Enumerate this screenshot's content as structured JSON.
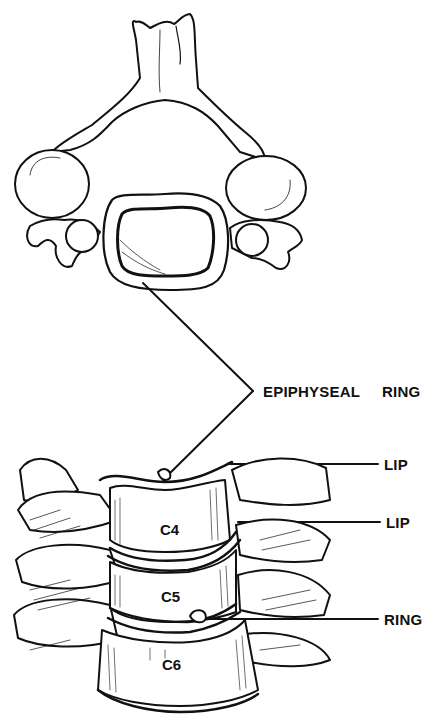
{
  "figure": {
    "header_text_cropped": "",
    "labels": {
      "epiphyseal": "EPIPHYSEAL",
      "ring_top": "RING",
      "lip_upper": "LIP",
      "lip_lower": "LIP",
      "ring_bottom": "RING"
    },
    "vertebrae": [
      "C4",
      "C5",
      "C6"
    ]
  }
}
